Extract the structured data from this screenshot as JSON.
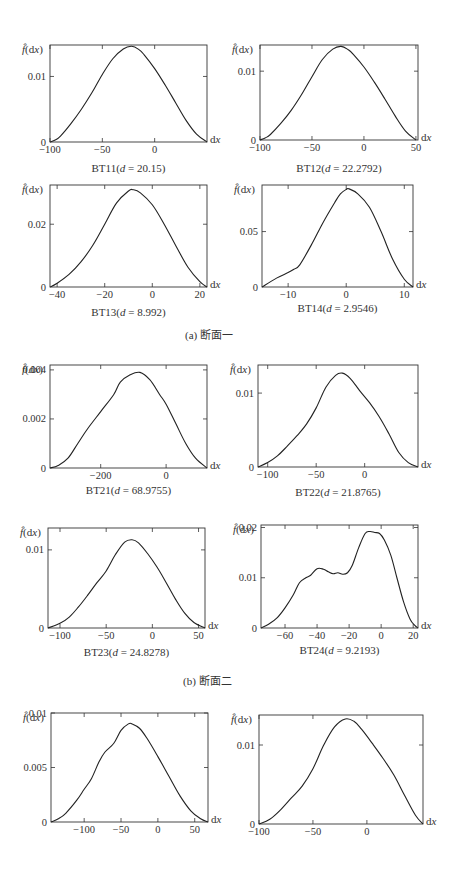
{
  "figure": {
    "group_captions": [
      {
        "label": "(a) 断面一",
        "x": 185,
        "y": 334
      },
      {
        "label": "(b) 断面二",
        "x": 183,
        "y": 680
      }
    ]
  },
  "chart_data": [
    {
      "type": "line",
      "id": "BT11",
      "title": "BT11(d = 20.15)",
      "title_prefix": "BT11(",
      "d_value": "20.15",
      "ylabel": "f̂(dx)",
      "xlabel": "dx",
      "xlim": [
        -100,
        50
      ],
      "ylim": [
        0,
        0.0148
      ],
      "xticks": [
        -100,
        -50,
        0
      ],
      "xtick_labels": [
        "−100",
        "−50",
        "0"
      ],
      "yticks": [
        0,
        0.01
      ],
      "ytick_labels": [
        "0",
        "0.01"
      ],
      "box": [
        50,
        45,
        207,
        142
      ],
      "caption_y": 172,
      "x": [
        -100,
        -95,
        -90,
        -80,
        -70,
        -60,
        -50,
        -40,
        -30,
        -22,
        -15,
        -10,
        0,
        10,
        20,
        30,
        40,
        50
      ],
      "y": [
        0,
        0.0003,
        0.0009,
        0.0028,
        0.005,
        0.0075,
        0.0103,
        0.0127,
        0.0142,
        0.0146,
        0.0141,
        0.0133,
        0.0112,
        0.0087,
        0.006,
        0.0033,
        0.0012,
        0
      ]
    },
    {
      "type": "line",
      "id": "BT12",
      "title": "BT12(d = 22.2792)",
      "title_prefix": "BT12(",
      "d_value": "22.2792",
      "ylabel": "f̂(dx)",
      "xlabel": "dx",
      "xlim": [
        -100,
        52
      ],
      "ylim": [
        0,
        0.0138
      ],
      "xticks": [
        -100,
        -50,
        0,
        50
      ],
      "xtick_labels": [
        "−100",
        "−50",
        "0",
        "50"
      ],
      "yticks": [
        0,
        0.01
      ],
      "ytick_labels": [
        "0",
        "0.01"
      ],
      "box": [
        260,
        45,
        418,
        140
      ],
      "caption_y": 172,
      "x": [
        -100,
        -95,
        -90,
        -80,
        -70,
        -60,
        -50,
        -40,
        -30,
        -22,
        -15,
        -10,
        0,
        10,
        20,
        30,
        40,
        50
      ],
      "y": [
        0,
        0.0003,
        0.0008,
        0.0024,
        0.0043,
        0.0066,
        0.0092,
        0.0117,
        0.0132,
        0.0136,
        0.0131,
        0.0124,
        0.0106,
        0.0084,
        0.006,
        0.0035,
        0.0013,
        0
      ]
    },
    {
      "type": "line",
      "id": "BT13",
      "title": "BT13(d = 8.992)",
      "title_prefix": "BT13(",
      "d_value": "8.992",
      "ylabel": "f̂(dx)",
      "xlabel": "dx",
      "xlim": [
        -43,
        23
      ],
      "ylim": [
        0,
        0.0325
      ],
      "xticks": [
        -40,
        -20,
        0,
        20
      ],
      "xtick_labels": [
        "−40",
        "−20",
        "0",
        "20"
      ],
      "yticks": [
        0,
        0.02
      ],
      "ytick_labels": [
        "0",
        "0.02"
      ],
      "box": [
        50,
        185,
        207,
        287
      ],
      "caption_y": 316,
      "x": [
        -43,
        -40,
        -35,
        -30,
        -25,
        -20,
        -15,
        -10,
        -8,
        -5,
        0,
        5,
        10,
        15,
        20,
        23
      ],
      "y": [
        0,
        0.0012,
        0.004,
        0.008,
        0.0133,
        0.02,
        0.0268,
        0.0306,
        0.031,
        0.03,
        0.0262,
        0.02,
        0.013,
        0.0063,
        0.0017,
        0
      ]
    },
    {
      "type": "line",
      "id": "BT14",
      "title": "BT14(d = 2.9546)",
      "title_prefix": "BT14(",
      "d_value": "2.9546",
      "ylabel": "f̂(dx)",
      "xlabel": "dx",
      "xlim": [
        -14.5,
        11.5
      ],
      "ylim": [
        0,
        0.092
      ],
      "xticks": [
        -10,
        0,
        10
      ],
      "xtick_labels": [
        "−10",
        "0",
        "10"
      ],
      "yticks": [
        0,
        0.05
      ],
      "ytick_labels": [
        "0",
        "0.05"
      ],
      "box": [
        262,
        185,
        413,
        287
      ],
      "caption_y": 312,
      "x": [
        -14.5,
        -12,
        -10,
        -9,
        -8,
        -6,
        -4,
        -2,
        -1,
        0,
        0.5,
        2,
        4,
        6,
        8,
        10,
        11.5
      ],
      "y": [
        0,
        0.008,
        0.013,
        0.016,
        0.02,
        0.038,
        0.058,
        0.076,
        0.084,
        0.088,
        0.0885,
        0.084,
        0.072,
        0.05,
        0.025,
        0.007,
        0
      ]
    },
    {
      "type": "line",
      "id": "BT21",
      "title": "BT21(d = 68.9755)",
      "title_prefix": "BT21(",
      "d_value": "68.9755",
      "ylabel": "f̂(dx)",
      "xlabel": "dx",
      "xlim": [
        -355,
        125
      ],
      "ylim": [
        0,
        0.0042
      ],
      "xticks": [
        -200,
        0
      ],
      "xtick_labels": [
        "−200",
        "0"
      ],
      "yticks": [
        0,
        0.002,
        0.004
      ],
      "ytick_labels": [
        "0",
        "0.002",
        "0.004"
      ],
      "box": [
        50,
        365,
        207,
        468
      ],
      "caption_y": 494,
      "x": [
        -355,
        -330,
        -300,
        -270,
        -240,
        -200,
        -160,
        -140,
        -110,
        -80,
        -50,
        -20,
        0,
        30,
        60,
        90,
        125
      ],
      "y": [
        0,
        0.0001,
        0.0004,
        0.001,
        0.0016,
        0.0023,
        0.003,
        0.0035,
        0.0038,
        0.0039,
        0.0036,
        0.003,
        0.0026,
        0.0018,
        0.001,
        0.0004,
        0
      ]
    },
    {
      "type": "line",
      "id": "BT22",
      "title": "BT22(d = 21.8765)",
      "title_prefix": "BT22(",
      "d_value": "21.8765",
      "ylabel": "f̂(dx)",
      "xlabel": "dx",
      "xlim": [
        -110,
        55
      ],
      "ylim": [
        0,
        0.0138
      ],
      "xticks": [
        -100,
        -50,
        0
      ],
      "xtick_labels": [
        "−100",
        "−50",
        "0"
      ],
      "yticks": [
        0,
        0.01
      ],
      "ytick_labels": [
        "0",
        "0.01"
      ],
      "box": [
        258,
        365,
        418,
        467
      ],
      "caption_y": 496,
      "x": [
        -110,
        -100,
        -90,
        -80,
        -70,
        -60,
        -50,
        -40,
        -30,
        -23,
        -15,
        -5,
        5,
        15,
        25,
        35,
        45,
        55
      ],
      "y": [
        0,
        0.0006,
        0.0015,
        0.0028,
        0.0042,
        0.0058,
        0.008,
        0.0108,
        0.0124,
        0.0127,
        0.012,
        0.0103,
        0.0087,
        0.0068,
        0.0045,
        0.002,
        0.0006,
        0
      ]
    },
    {
      "type": "line",
      "id": "BT23",
      "title": "BT23(d = 24.8278)",
      "title_prefix": "BT23(",
      "d_value": "24.8278",
      "ylabel": "f̂(dx)",
      "xlabel": "dx",
      "xlim": [
        -113,
        57
      ],
      "ylim": [
        0,
        0.0128
      ],
      "xticks": [
        -100,
        -50,
        0,
        50
      ],
      "xtick_labels": [
        "−100",
        "−50",
        "0",
        "50"
      ],
      "yticks": [
        0,
        0.01
      ],
      "ytick_labels": [
        "0",
        "0.01"
      ],
      "box": [
        48,
        528,
        205,
        628
      ],
      "caption_y": 656,
      "x": [
        -113,
        -100,
        -90,
        -80,
        -70,
        -60,
        -50,
        -40,
        -30,
        -22,
        -15,
        -5,
        5,
        15,
        25,
        35,
        45,
        57
      ],
      "y": [
        0,
        0.0006,
        0.0014,
        0.0027,
        0.0042,
        0.0058,
        0.0073,
        0.0094,
        0.011,
        0.0113,
        0.0109,
        0.0095,
        0.0078,
        0.0058,
        0.0037,
        0.0019,
        0.0007,
        0
      ]
    },
    {
      "type": "line",
      "id": "BT24",
      "title": "BT24(d = 9.2193)",
      "title_prefix": "BT24(",
      "d_value": "9.2193",
      "ylabel": "f̂(dx)",
      "xlabel": "dx",
      "xlim": [
        -75,
        23
      ],
      "ylim": [
        0,
        0.0205
      ],
      "xticks": [
        -60,
        -40,
        -20,
        0,
        20
      ],
      "xtick_labels": [
        "−60",
        "−40",
        "−20",
        "0",
        "20"
      ],
      "yticks": [
        0,
        0.01,
        0.02
      ],
      "ytick_labels": [
        "0",
        "0.01",
        "0.02"
      ],
      "box": [
        261,
        525,
        418,
        628
      ],
      "caption_y": 654,
      "x": [
        -75,
        -70,
        -65,
        -60,
        -55,
        -51,
        -47,
        -44,
        -40,
        -36,
        -33,
        -30,
        -27,
        -24,
        -21,
        -18,
        -14,
        -10,
        -7,
        -4,
        -1,
        2,
        6,
        10,
        14,
        18,
        21,
        23
      ],
      "y": [
        0,
        0.0008,
        0.002,
        0.004,
        0.0065,
        0.009,
        0.01,
        0.0105,
        0.0118,
        0.0117,
        0.0112,
        0.0108,
        0.011,
        0.0107,
        0.011,
        0.0125,
        0.016,
        0.0188,
        0.0192,
        0.019,
        0.0188,
        0.0175,
        0.0145,
        0.0098,
        0.0052,
        0.0018,
        0.0005,
        0
      ]
    },
    {
      "type": "line",
      "id": "BT31",
      "title": "",
      "ylabel": "f̂(dx)",
      "xlabel": "dx",
      "xlim": [
        -145,
        68
      ],
      "ylim": [
        0,
        0.01
      ],
      "xticks": [
        -100,
        -50,
        0,
        50
      ],
      "xtick_labels": [
        "−100",
        "−50",
        "0",
        "50"
      ],
      "yticks": [
        0,
        0.005,
        0.01
      ],
      "ytick_labels": [
        "0",
        "0.005",
        "0.01"
      ],
      "box": [
        51,
        713,
        208,
        822
      ],
      "caption_y": null,
      "x": [
        -145,
        -135,
        -125,
        -110,
        -100,
        -90,
        -80,
        -72,
        -60,
        -50,
        -40,
        -35,
        -25,
        -15,
        0,
        15,
        30,
        45,
        58,
        68
      ],
      "y": [
        0,
        0.0003,
        0.0008,
        0.002,
        0.003,
        0.004,
        0.0055,
        0.0064,
        0.0072,
        0.0084,
        0.009,
        0.009,
        0.0086,
        0.0077,
        0.006,
        0.0042,
        0.0024,
        0.001,
        0.0003,
        0
      ]
    },
    {
      "type": "line",
      "id": "BT32",
      "title": "",
      "ylabel": "f̂(dx)",
      "xlabel": "dx",
      "xlim": [
        -100,
        52
      ],
      "ylim": [
        0,
        0.0138
      ],
      "xticks": [
        -100,
        -50,
        0
      ],
      "xtick_labels": [
        "−100",
        "−50",
        "0"
      ],
      "yticks": [
        0,
        0.01
      ],
      "ytick_labels": [
        "0",
        "0.01"
      ],
      "box": [
        259,
        715,
        423,
        824
      ],
      "caption_y": null,
      "x": [
        -100,
        -90,
        -80,
        -70,
        -60,
        -50,
        -40,
        -30,
        -20,
        -12,
        -5,
        5,
        15,
        25,
        35,
        45,
        52
      ],
      "y": [
        0,
        0.0006,
        0.0018,
        0.0033,
        0.0048,
        0.007,
        0.01,
        0.0123,
        0.0133,
        0.013,
        0.012,
        0.0102,
        0.0083,
        0.0062,
        0.0036,
        0.0011,
        0
      ]
    }
  ]
}
